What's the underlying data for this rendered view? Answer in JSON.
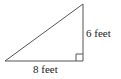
{
  "diagram": {
    "type": "right-triangle",
    "colors": {
      "stroke": "#555555",
      "text": "#222222",
      "background": "#ffffff"
    },
    "vertices": {
      "bottom_left": [
        5,
        61
      ],
      "bottom_right": [
        83,
        61
      ],
      "top": [
        83,
        4
      ]
    },
    "right_angle_marker": "bottom-right",
    "labels": {
      "vertical_side": "6 feet",
      "horizontal_side": "8 feet"
    }
  }
}
